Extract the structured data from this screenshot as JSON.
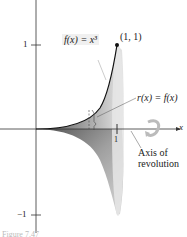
{
  "figure": {
    "function_label": "f(x) = x³",
    "point_label": "(1, 1)",
    "radius_label": "r(x) = f(x)",
    "axis_label_line1": "Axis of",
    "axis_label_line2": "revolution",
    "x_axis_label": "x",
    "tick_y_pos": "1",
    "tick_y_neg": "−1",
    "tick_x": "1",
    "caption": "Figure 7.47"
  }
}
